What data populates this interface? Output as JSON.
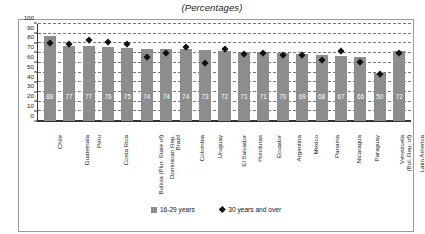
{
  "chart_data": {
    "type": "bar",
    "title": "(Percentages)",
    "xlabel": "",
    "ylabel": "",
    "ylim": [
      0,
      100
    ],
    "ytick_step": 10,
    "yticks": [
      0,
      10,
      20,
      30,
      40,
      50,
      60,
      70,
      80,
      90,
      100
    ],
    "grid": true,
    "legend_position": "bottom-center",
    "categories": [
      "Chile",
      "Guatemala",
      "Peru",
      "Costa Rica",
      "Bolivia (Plur. State of)",
      "Dominican Rep.",
      "Brazil",
      "Colombia",
      "Uruguay",
      "El Salvador",
      "Honduras",
      "Ecuador",
      "Argentina",
      "Mexico",
      "Panama",
      "Nicaragua",
      "Paraguay",
      "Venezuela (Bol. Rep. of)",
      "Latin America"
    ],
    "category_lines": [
      [
        "Chile",
        ""
      ],
      [
        "Guatemala",
        ""
      ],
      [
        "Peru",
        ""
      ],
      [
        "Costa Rica",
        ""
      ],
      [
        "Bolivia (Plur. State of)",
        ""
      ],
      [
        "Dominican Rep.",
        ""
      ],
      [
        "Brazil",
        ""
      ],
      [
        "Colombia",
        ""
      ],
      [
        "Uruguay",
        ""
      ],
      [
        "El Salvador",
        ""
      ],
      [
        "Honduras",
        ""
      ],
      [
        "Ecuador",
        ""
      ],
      [
        "Argentina",
        ""
      ],
      [
        "Mexico",
        ""
      ],
      [
        "Panama",
        ""
      ],
      [
        "Nicaragua",
        ""
      ],
      [
        "Paraguay",
        ""
      ],
      [
        "Venezuela",
        "(Bol. Rep. of)"
      ],
      [
        "Latin America",
        ""
      ]
    ],
    "series": [
      {
        "name": "16-29 years",
        "type": "bar",
        "color": "#8d8d8d",
        "values": [
          88,
          77,
          77,
          76,
          75,
          74,
          74,
          74,
          73,
          72,
          71,
          71,
          70,
          69,
          68,
          67,
          66,
          50,
          72
        ]
      },
      {
        "name": "30 years and over",
        "type": "marker",
        "color": "#111111",
        "marker": "diamond",
        "values": [
          80,
          79,
          83,
          81,
          79,
          66,
          70,
          76,
          59,
          74,
          69,
          70,
          68,
          68,
          62,
          72,
          60,
          48,
          70
        ]
      }
    ]
  },
  "legend": {
    "items": [
      {
        "label": "16-29 years",
        "icon": "square-swatch"
      },
      {
        "label": "30 years and over",
        "icon": "diamond-swatch"
      }
    ]
  }
}
